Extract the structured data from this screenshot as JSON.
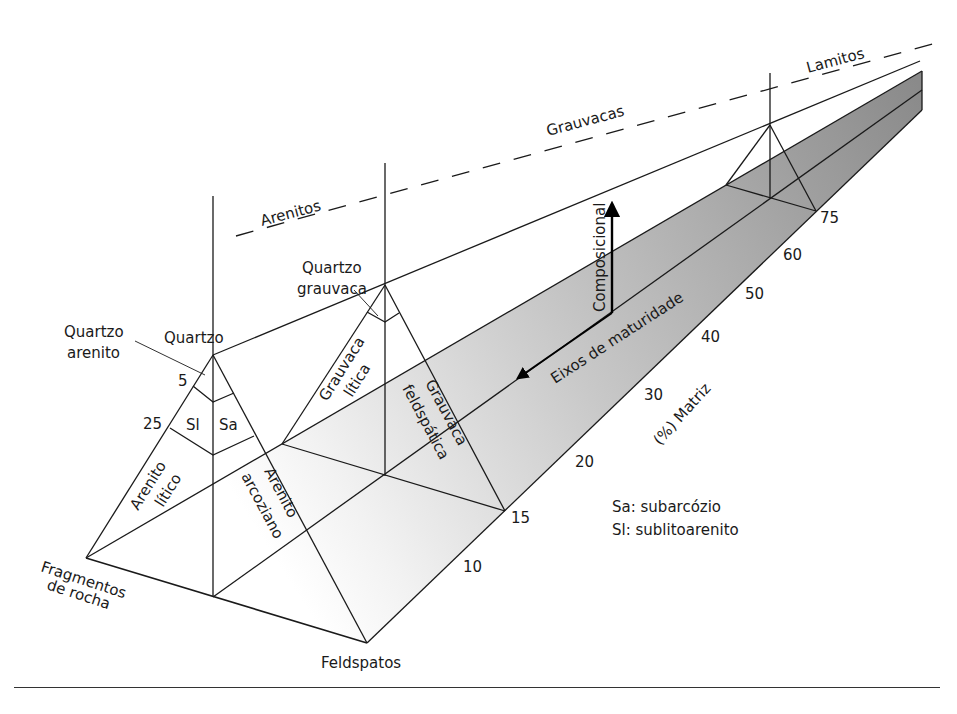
{
  "diagram": {
    "facies_labels": {
      "arenitos": "Arenitos",
      "grauvacas": "Grauvacas",
      "lamitos": "Lamitos"
    },
    "vertices": {
      "quartzo": "Quartzo",
      "fragmentos_line1": "Fragmentos",
      "fragmentos_line2": "de rocha",
      "feldspatos": "Feldspatos"
    },
    "fields": {
      "quartzo_arenito_line1": "Quartzo",
      "quartzo_arenito_line2": "arenito",
      "sl": "Sl",
      "sa": "Sa",
      "arenito_litico_line1": "Arenito",
      "arenito_litico_line2": "lítico",
      "arenito_arcoziano_line1": "Arenito",
      "arenito_arcoziano_line2": "arcoziano",
      "quartzo_grauvaca_line1": "Quartzo",
      "quartzo_grauvaca_line2": "grauvaca",
      "grauvaca_litica_line1": "Grauvaca",
      "grauvaca_litica_line2": "lítica",
      "grauvaca_feldspatica_line1": "Grauvaca",
      "grauvaca_feldspatica_line2": "feldspática"
    },
    "quartz_ticks": [
      "5",
      "25"
    ],
    "matrix_axis": {
      "label": "(%) Matriz",
      "ticks": [
        "10",
        "15",
        "20",
        "30",
        "40",
        "50",
        "60",
        "75"
      ]
    },
    "maturity_axes": {
      "compositional": "Composicional",
      "textural": "Eixos de maturidade"
    },
    "legend": [
      "Sa: subarcózio",
      "Sl: sublitoarenito"
    ],
    "colors": {
      "line": "#1a1a1a",
      "shade_light": "#f4f4f4",
      "shade_mid": "#c9c9c9",
      "shade_dark": "#8c8c8c"
    }
  }
}
